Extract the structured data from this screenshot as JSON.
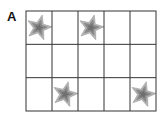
{
  "panel_label": "A",
  "grid": {
    "rows": 3,
    "cols": 5,
    "line_color": "#333333",
    "star_outer_color": "#b5b5b5",
    "star_inner_color": "#8a8a8a",
    "star_core_color": "#6e6e6e"
  },
  "stars": [
    {
      "row": 0,
      "col": 0
    },
    {
      "row": 0,
      "col": 2
    },
    {
      "row": 2,
      "col": 1
    },
    {
      "row": 2,
      "col": 4
    }
  ]
}
